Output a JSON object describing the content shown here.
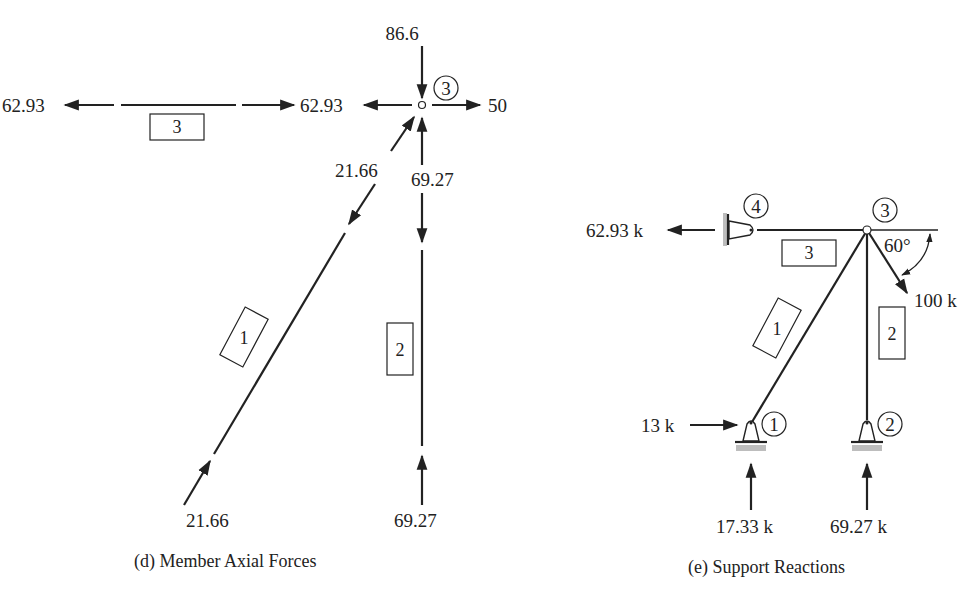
{
  "diagram_d": {
    "caption": "(d) Member Axial Forces",
    "joint_label": "3",
    "joint_loads": {
      "top": "86.6",
      "right": "50",
      "left": "62.93"
    },
    "member3": {
      "label": "3",
      "left_force": "62.93"
    },
    "member1": {
      "label": "1",
      "top_force": "21.66",
      "bottom_force": "21.66"
    },
    "member2": {
      "label": "2",
      "top_force": "69.27",
      "bottom_force": "69.27"
    }
  },
  "diagram_e": {
    "caption": "(e) Support Reactions",
    "joints": {
      "j1": "1",
      "j2": "2",
      "j3": "3",
      "j4": "4"
    },
    "members": {
      "m1": "1",
      "m2": "2",
      "m3": "3"
    },
    "reactions": {
      "j4_horizontal": "62.93 k",
      "j1_horizontal": "13 k",
      "j1_vertical": "17.33 k",
      "j2_vertical": "69.27 k"
    },
    "applied_load": {
      "value": "100 k",
      "angle": "60°"
    }
  }
}
